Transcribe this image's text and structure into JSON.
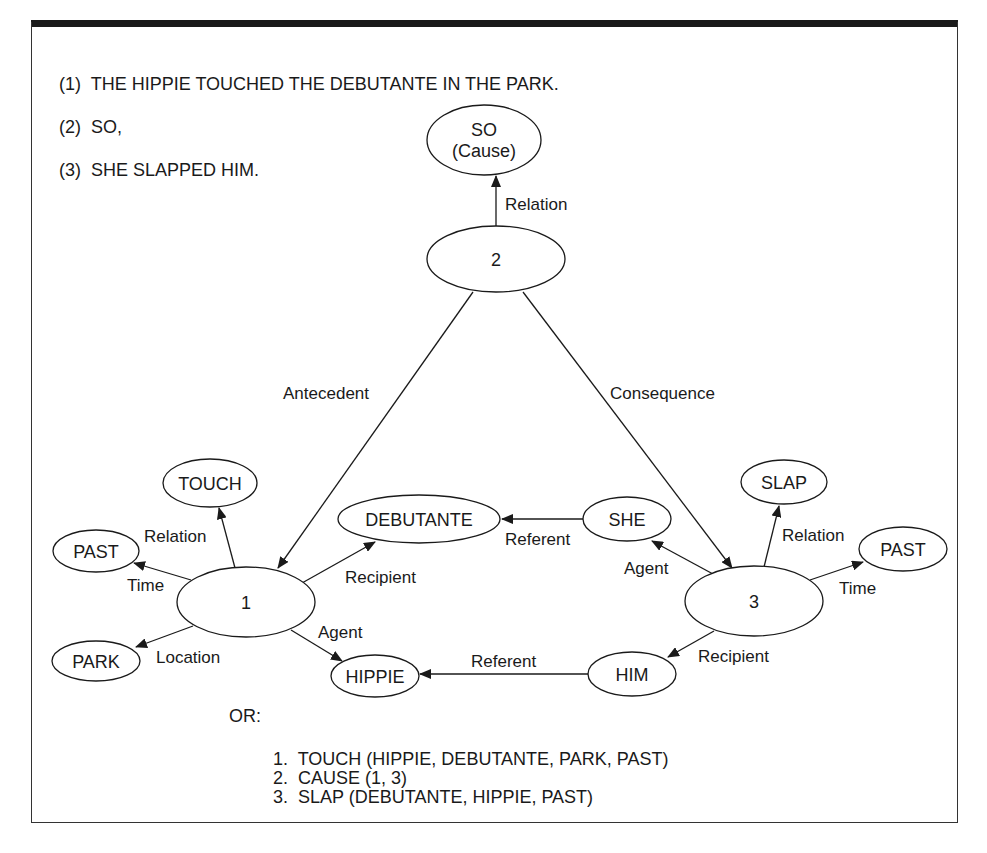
{
  "sentences": [
    {
      "num": "(1)",
      "text": "THE HIPPIE TOUCHED THE DEBUTANTE IN THE PARK."
    },
    {
      "num": "(2)",
      "text": "SO,"
    },
    {
      "num": "(3)",
      "text": "SHE SLAPPED HIM."
    }
  ],
  "nodes": {
    "so_cause": {
      "line1": "SO",
      "line2": "(Cause)"
    },
    "n2": "2",
    "n1": "1",
    "n3": "3",
    "touch": "TOUCH",
    "past_left": "PAST",
    "park": "PARK",
    "debutante": "DEBUTANTE",
    "hippie": "HIPPIE",
    "she": "SHE",
    "him": "HIM",
    "slap": "SLAP",
    "past_right": "PAST"
  },
  "edges": {
    "relation_top": "Relation",
    "antecedent": "Antecedent",
    "consequence": "Consequence",
    "relation_1": "Relation",
    "time_1": "Time",
    "location_1": "Location",
    "recipient_1": "Recipient",
    "agent_1": "Agent",
    "referent_she": "Referent",
    "referent_him": "Referent",
    "agent_3": "Agent",
    "relation_3": "Relation",
    "time_3": "Time",
    "recipient_3": "Recipient"
  },
  "or_label": "OR:",
  "propositions": [
    "1.  TOUCH (HIPPIE, DEBUTANTE, PARK, PAST)",
    "2.  CAUSE (1, 3)",
    "3.  SLAP (DEBUTANTE, HIPPIE, PAST)"
  ]
}
